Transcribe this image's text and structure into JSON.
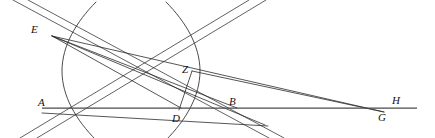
{
  "figure": {
    "width": 435,
    "height": 138,
    "background_color": "#ffffff",
    "stroke_color": "#2b2b2b",
    "baseline_color": "#4a4a4a"
  },
  "labels": [
    {
      "id": "E",
      "text": "E",
      "x": 31,
      "y": 24
    },
    {
      "id": "Z",
      "text": "Z",
      "x": 182,
      "y": 64
    },
    {
      "id": "A",
      "text": "A",
      "x": 38,
      "y": 97
    },
    {
      "id": "D",
      "text": "D",
      "x": 172,
      "y": 113
    },
    {
      "id": "B",
      "text": "B",
      "x": 229,
      "y": 96
    },
    {
      "id": "G",
      "text": "G",
      "x": 378,
      "y": 112
    },
    {
      "id": "H",
      "text": "H",
      "x": 392,
      "y": 95
    }
  ],
  "points": {
    "E": {
      "x": 52,
      "y": 36
    },
    "Z": {
      "x": 192,
      "y": 71
    },
    "A": {
      "x": 47,
      "y": 108
    },
    "D": {
      "x": 181,
      "y": 108
    },
    "B": {
      "x": 237,
      "y": 108
    },
    "G": {
      "x": 384,
      "y": 112
    },
    "H": {
      "x": 404,
      "y": 108
    },
    "center": {
      "x": 131,
      "y": 71
    }
  },
  "curves": {
    "left_branch": "M 96 2 C 76 22 62 46 62 71 C 62 96 76 120 96 140",
    "right_branch": "M 166 2 C 186 22 200 46 200 71 C 200 96 186 120 166 140"
  },
  "lines": {
    "asymptote_upper": "M 13 0 L 269 138",
    "asymptote_lower": "M 28 0 L 284 138",
    "asymptote_rising_a": "M 249 0 L 20 138",
    "asymptote_rising_b": "M 266 0 L 37 138",
    "baseline_AH": "M 42 108 L 417 108",
    "E_to_G": "M 52 36 L 384 112",
    "E_to_D": "M 52 36 L 181 108",
    "E_to_B": "M 52 36 L 237 108",
    "E_to_beyond": "M 52 36 L 265 125",
    "Z_to_D": "M 192 71 L 179 110",
    "Z_to_G": "M 192 71 L 384 112",
    "A_to_Z_beyond": "M 42 113 L 268 126"
  },
  "labels_meta": {
    "font_style": "italic serif",
    "font_size_px": 11
  }
}
